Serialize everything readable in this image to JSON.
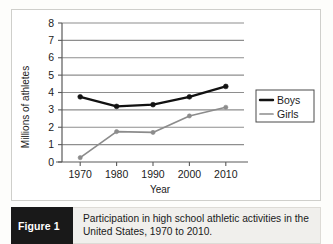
{
  "figure": {
    "tag_label": "Figure 1",
    "caption": "Participation in high school athletic activities in the United States, 1970 to 2010."
  },
  "chart_data": {
    "type": "line",
    "title": "",
    "xlabel": "Year",
    "ylabel": "Millions of athletes",
    "categories": [
      "1970",
      "1980",
      "1990",
      "2000",
      "2010"
    ],
    "x": [
      1970,
      1980,
      1990,
      2000,
      2010
    ],
    "xlim": [
      1965,
      2015
    ],
    "ylim": [
      0,
      8
    ],
    "yticks": [
      0,
      1,
      2,
      3,
      4,
      5,
      6,
      7,
      8
    ],
    "grid": "horizontal",
    "legend_position": "right",
    "series": [
      {
        "name": "Boys",
        "color": "#121212",
        "values": [
          3.75,
          3.2,
          3.3,
          3.75,
          4.35
        ]
      },
      {
        "name": "Girls",
        "color": "#8c8c8c",
        "values": [
          0.25,
          1.75,
          1.7,
          2.65,
          3.15
        ]
      }
    ]
  },
  "axis": {
    "y_tick_labels": [
      "8",
      "7",
      "6",
      "5",
      "4",
      "3",
      "2",
      "1",
      "0"
    ],
    "y_title": "Millions of athletes",
    "x_tick_labels": [
      "1970",
      "1980",
      "1990",
      "2000",
      "2010"
    ],
    "x_title": "Year"
  },
  "legend": {
    "items": [
      {
        "label": "Boys",
        "color": "#121212"
      },
      {
        "label": "Girls",
        "color": "#8c8c8c"
      }
    ]
  },
  "colors": {
    "boys": "#121212",
    "girls": "#8c8c8c",
    "gridline": "#8e8e8e",
    "axis": "#5a5a5a",
    "caption_tag_bg": "#191919",
    "caption_bg": "#f0efec"
  }
}
